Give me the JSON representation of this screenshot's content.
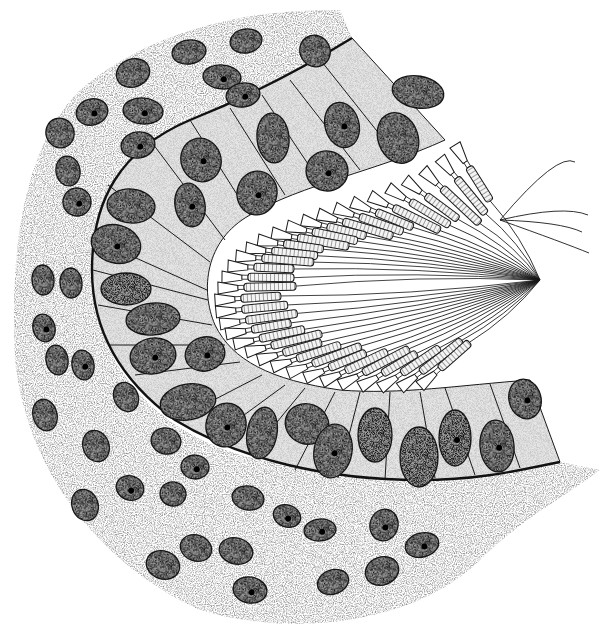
{
  "figure": {
    "width": 609,
    "height": 630,
    "background": "#ffffff",
    "style": "stippled pen-and-ink histology drawing"
  },
  "colors": {
    "ink": "#1a1a1a",
    "cell_fill": "#e6e6e6",
    "lumen_fill": "#ffffff",
    "connective_stipple": "#d0d0d0",
    "nucleus_fill": "#6e6e6e",
    "nucleolus": "#000000",
    "basement_membrane": "#111111"
  },
  "basement_membrane": {
    "path": "M352,38 C300,70 240,100 190,120 C120,150 92,200 92,270 C92,330 120,380 175,420 C240,460 330,480 420,480 C480,480 520,470 560,462"
  },
  "epithelium_apical_edge": {
    "path": "M445,140 C380,170 300,185 250,215 C205,240 200,290 215,325 C232,360 270,380 340,390 C400,395 460,385 530,380"
  },
  "cell_boundaries": [
    "M352,38 L445,140",
    "M322,62 L400,160",
    "M290,80 L360,170",
    "M262,95 L320,182",
    "M230,108 L285,195",
    "M190,120 L250,215",
    "M150,140 L225,240",
    "M108,185 L210,262",
    "M96,240 L207,290",
    "M93,270 L208,300",
    "M98,305 L212,325",
    "M110,345 L225,345",
    "M135,375 L240,362",
    "M175,420 L262,375",
    "M210,440 L285,385",
    "M250,455 L305,388",
    "M295,470 L335,392",
    "M338,478 L360,392",
    "M385,480 L390,392",
    "M435,478 L420,392",
    "M475,475 L445,388",
    "M520,468 L490,384",
    "M560,462 L530,380"
  ],
  "epithelial_nuclei": [
    {
      "cx": 418,
      "cy": 92,
      "rx": 26,
      "ry": 16,
      "rot": 10,
      "nucleolus": false
    },
    {
      "cx": 398,
      "cy": 138,
      "rx": 20,
      "ry": 26,
      "rot": -20,
      "nucleolus": false
    },
    {
      "cx": 342,
      "cy": 125,
      "rx": 17,
      "ry": 23,
      "rot": -15,
      "nucleolus": true
    },
    {
      "cx": 327,
      "cy": 171,
      "rx": 21,
      "ry": 20,
      "rot": 10,
      "nucleolus": true
    },
    {
      "cx": 273,
      "cy": 138,
      "rx": 16,
      "ry": 25,
      "rot": -5,
      "nucleolus": false
    },
    {
      "cx": 257,
      "cy": 193,
      "rx": 20,
      "ry": 22,
      "rot": 10,
      "nucleolus": true
    },
    {
      "cx": 201,
      "cy": 160,
      "rx": 20,
      "ry": 22,
      "rot": -20,
      "nucleolus": true
    },
    {
      "cx": 190,
      "cy": 205,
      "rx": 15,
      "ry": 22,
      "rot": -10,
      "nucleolus": true
    },
    {
      "cx": 131,
      "cy": 206,
      "rx": 24,
      "ry": 17,
      "rot": 5,
      "nucleolus": false
    },
    {
      "cx": 116,
      "cy": 244,
      "rx": 25,
      "ry": 19,
      "rot": 15,
      "nucleolus": true
    },
    {
      "cx": 126,
      "cy": 289,
      "rx": 25,
      "ry": 16,
      "rot": 0,
      "nucleolus": false
    },
    {
      "cx": 153,
      "cy": 319,
      "rx": 27,
      "ry": 16,
      "rot": -5,
      "nucleolus": false
    },
    {
      "cx": 153,
      "cy": 356,
      "rx": 23,
      "ry": 18,
      "rot": -10,
      "nucleolus": true
    },
    {
      "cx": 205,
      "cy": 354,
      "rx": 20,
      "ry": 17,
      "rot": -15,
      "nucleolus": true
    },
    {
      "cx": 188,
      "cy": 402,
      "rx": 28,
      "ry": 18,
      "rot": -10,
      "nucleolus": false
    },
    {
      "cx": 226,
      "cy": 425,
      "rx": 20,
      "ry": 22,
      "rot": 15,
      "nucleolus": true
    },
    {
      "cx": 262,
      "cy": 433,
      "rx": 15,
      "ry": 26,
      "rot": 10,
      "nucleolus": false
    },
    {
      "cx": 307,
      "cy": 424,
      "rx": 22,
      "ry": 20,
      "rot": 20,
      "nucleolus": false
    },
    {
      "cx": 333,
      "cy": 451,
      "rx": 19,
      "ry": 27,
      "rot": 10,
      "nucleolus": true
    },
    {
      "cx": 375,
      "cy": 435,
      "rx": 17,
      "ry": 27,
      "rot": 0,
      "nucleolus": false
    },
    {
      "cx": 419,
      "cy": 457,
      "rx": 19,
      "ry": 30,
      "rot": 0,
      "nucleolus": false
    },
    {
      "cx": 455,
      "cy": 438,
      "rx": 16,
      "ry": 28,
      "rot": 0,
      "nucleolus": true
    },
    {
      "cx": 497,
      "cy": 446,
      "rx": 17,
      "ry": 26,
      "rot": -5,
      "nucleolus": true
    },
    {
      "cx": 525,
      "cy": 399,
      "rx": 16,
      "ry": 20,
      "rot": -15,
      "nucleolus": true
    }
  ],
  "connective_nuclei": [
    {
      "cx": 246,
      "cy": 41,
      "rx": 16,
      "ry": 12,
      "rot": -10,
      "nucleolus": false
    },
    {
      "cx": 189,
      "cy": 52,
      "rx": 17,
      "ry": 12,
      "rot": -10,
      "nucleolus": false
    },
    {
      "cx": 133,
      "cy": 73,
      "rx": 17,
      "ry": 14,
      "rot": -20,
      "nucleolus": false
    },
    {
      "cx": 222,
      "cy": 77,
      "rx": 19,
      "ry": 12,
      "rot": 5,
      "nucleolus": true
    },
    {
      "cx": 243,
      "cy": 95,
      "rx": 17,
      "ry": 12,
      "rot": -10,
      "nucleolus": true
    },
    {
      "cx": 315,
      "cy": 51,
      "rx": 15,
      "ry": 16,
      "rot": -30,
      "nucleolus": false
    },
    {
      "cx": 92,
      "cy": 112,
      "rx": 16,
      "ry": 13,
      "rot": -15,
      "nucleolus": true
    },
    {
      "cx": 143,
      "cy": 111,
      "rx": 20,
      "ry": 13,
      "rot": 5,
      "nucleolus": true
    },
    {
      "cx": 138,
      "cy": 145,
      "rx": 17,
      "ry": 13,
      "rot": -10,
      "nucleolus": true
    },
    {
      "cx": 60,
      "cy": 133,
      "rx": 14,
      "ry": 15,
      "rot": -20,
      "nucleolus": false
    },
    {
      "cx": 68,
      "cy": 171,
      "rx": 12,
      "ry": 15,
      "rot": -10,
      "nucleolus": false
    },
    {
      "cx": 77,
      "cy": 202,
      "rx": 14,
      "ry": 14,
      "rot": -10,
      "nucleolus": true
    },
    {
      "cx": 43,
      "cy": 280,
      "rx": 11,
      "ry": 15,
      "rot": -5,
      "nucleolus": false
    },
    {
      "cx": 71,
      "cy": 283,
      "rx": 11,
      "ry": 15,
      "rot": -5,
      "nucleolus": false
    },
    {
      "cx": 44,
      "cy": 328,
      "rx": 11,
      "ry": 14,
      "rot": -15,
      "nucleolus": true
    },
    {
      "cx": 57,
      "cy": 360,
      "rx": 11,
      "ry": 15,
      "rot": -10,
      "nucleolus": false
    },
    {
      "cx": 83,
      "cy": 365,
      "rx": 11,
      "ry": 15,
      "rot": -10,
      "nucleolus": true
    },
    {
      "cx": 45,
      "cy": 415,
      "rx": 12,
      "ry": 16,
      "rot": -15,
      "nucleolus": false
    },
    {
      "cx": 126,
      "cy": 397,
      "rx": 12,
      "ry": 15,
      "rot": -25,
      "nucleolus": false
    },
    {
      "cx": 96,
      "cy": 446,
      "rx": 13,
      "ry": 16,
      "rot": -20,
      "nucleolus": false
    },
    {
      "cx": 166,
      "cy": 441,
      "rx": 15,
      "ry": 13,
      "rot": 15,
      "nucleolus": false
    },
    {
      "cx": 195,
      "cy": 467,
      "rx": 14,
      "ry": 12,
      "rot": 5,
      "nucleolus": true
    },
    {
      "cx": 130,
      "cy": 488,
      "rx": 14,
      "ry": 12,
      "rot": 20,
      "nucleolus": true
    },
    {
      "cx": 173,
      "cy": 494,
      "rx": 13,
      "ry": 12,
      "rot": 10,
      "nucleolus": false
    },
    {
      "cx": 85,
      "cy": 505,
      "rx": 13,
      "ry": 16,
      "rot": -20,
      "nucleolus": false
    },
    {
      "cx": 248,
      "cy": 498,
      "rx": 16,
      "ry": 12,
      "rot": 10,
      "nucleolus": false
    },
    {
      "cx": 287,
      "cy": 516,
      "rx": 14,
      "ry": 11,
      "rot": 20,
      "nucleolus": true
    },
    {
      "cx": 320,
      "cy": 530,
      "rx": 16,
      "ry": 11,
      "rot": -5,
      "nucleolus": true
    },
    {
      "cx": 384,
      "cy": 525,
      "rx": 14,
      "ry": 16,
      "rot": 15,
      "nucleolus": true
    },
    {
      "cx": 422,
      "cy": 545,
      "rx": 17,
      "ry": 12,
      "rot": -15,
      "nucleolus": true
    },
    {
      "cx": 196,
      "cy": 548,
      "rx": 16,
      "ry": 13,
      "rot": 20,
      "nucleolus": false
    },
    {
      "cx": 236,
      "cy": 551,
      "rx": 17,
      "ry": 13,
      "rot": 15,
      "nucleolus": false
    },
    {
      "cx": 163,
      "cy": 565,
      "rx": 17,
      "ry": 14,
      "rot": 20,
      "nucleolus": false
    },
    {
      "cx": 250,
      "cy": 590,
      "rx": 17,
      "ry": 13,
      "rot": 10,
      "nucleolus": true
    },
    {
      "cx": 333,
      "cy": 582,
      "rx": 16,
      "ry": 12,
      "rot": -20,
      "nucleolus": false
    },
    {
      "cx": 382,
      "cy": 571,
      "rx": 17,
      "ry": 14,
      "rot": -20,
      "nucleolus": false
    }
  ],
  "flagellated_cells": {
    "count_upper": 18,
    "count_lower": 16,
    "convergence_point": {
      "x": 540,
      "y": 280
    },
    "lumen_edge_upper": [
      {
        "x": 455,
        "y": 145
      },
      {
        "x": 440,
        "y": 158
      },
      {
        "x": 423,
        "y": 170
      },
      {
        "x": 405,
        "y": 180
      },
      {
        "x": 388,
        "y": 188
      },
      {
        "x": 370,
        "y": 196
      },
      {
        "x": 352,
        "y": 202
      },
      {
        "x": 335,
        "y": 208
      },
      {
        "x": 318,
        "y": 214
      },
      {
        "x": 302,
        "y": 220
      },
      {
        "x": 287,
        "y": 226
      },
      {
        "x": 272,
        "y": 233
      },
      {
        "x": 258,
        "y": 240
      },
      {
        "x": 246,
        "y": 248
      },
      {
        "x": 236,
        "y": 256
      },
      {
        "x": 228,
        "y": 266
      },
      {
        "x": 222,
        "y": 277
      },
      {
        "x": 218,
        "y": 288
      }
    ],
    "lumen_edge_lower": [
      {
        "x": 215,
        "y": 300
      },
      {
        "x": 216,
        "y": 312
      },
      {
        "x": 220,
        "y": 324
      },
      {
        "x": 226,
        "y": 334
      },
      {
        "x": 234,
        "y": 344
      },
      {
        "x": 246,
        "y": 352
      },
      {
        "x": 258,
        "y": 360
      },
      {
        "x": 272,
        "y": 367
      },
      {
        "x": 288,
        "y": 373
      },
      {
        "x": 305,
        "y": 378
      },
      {
        "x": 322,
        "y": 382
      },
      {
        "x": 340,
        "y": 385
      },
      {
        "x": 360,
        "y": 387
      },
      {
        "x": 380,
        "y": 388
      },
      {
        "x": 400,
        "y": 388
      },
      {
        "x": 420,
        "y": 386
      }
    ],
    "long_free_flagella_ends": [
      {
        "x": 575,
        "y": 162
      },
      {
        "x": 588,
        "y": 215
      },
      {
        "x": 582,
        "y": 232
      },
      {
        "x": 589,
        "y": 253
      }
    ]
  }
}
